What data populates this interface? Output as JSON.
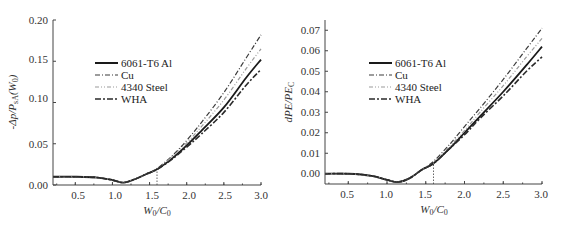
{
  "chart_data": [
    {
      "type": "line",
      "title": "",
      "xlabel": "W0/C0",
      "ylabel": "-Δp/P_sA(W0)",
      "xlim": [
        0.2,
        3.0
      ],
      "ylim": [
        0.0,
        0.2
      ],
      "xticks": [
        "0.5",
        "1.0",
        "1.5",
        "2.0",
        "2.5",
        "3.0"
      ],
      "yticks": [
        "0.00",
        "0.05",
        "0.10",
        "0.15",
        "0.20"
      ],
      "grid": false,
      "legend_position": "upper-left-center",
      "annotation": "vertical dotted line at W0/C0 = 1.6",
      "x": [
        0.2,
        0.5,
        0.8,
        1.0,
        1.15,
        1.3,
        1.45,
        1.6,
        1.8,
        2.0,
        2.2,
        2.5,
        2.8,
        3.0
      ],
      "series": [
        {
          "name": "6061-T6 Al",
          "style": "solid",
          "values": [
            0.01,
            0.01,
            0.009,
            0.006,
            0.003,
            0.007,
            0.013,
            0.019,
            0.032,
            0.048,
            0.066,
            0.094,
            0.13,
            0.152
          ]
        },
        {
          "name": "Cu",
          "style": "dash-dot",
          "values": [
            0.01,
            0.01,
            0.009,
            0.006,
            0.003,
            0.007,
            0.013,
            0.02,
            0.035,
            0.054,
            0.076,
            0.112,
            0.154,
            0.182
          ]
        },
        {
          "name": "4340 Steel",
          "style": "dash-dot-dot-light",
          "values": [
            0.01,
            0.01,
            0.009,
            0.006,
            0.003,
            0.007,
            0.013,
            0.019,
            0.034,
            0.051,
            0.071,
            0.103,
            0.141,
            0.165
          ]
        },
        {
          "name": "WHA",
          "style": "dash-dot-heavy",
          "values": [
            0.01,
            0.01,
            0.009,
            0.006,
            0.003,
            0.007,
            0.013,
            0.019,
            0.031,
            0.046,
            0.062,
            0.088,
            0.121,
            0.14
          ]
        }
      ]
    },
    {
      "type": "line",
      "title": "",
      "xlabel": "W0/C0",
      "ylabel": "dPE/PE_C",
      "xlim": [
        0.2,
        3.0
      ],
      "ylim": [
        -0.005,
        0.075
      ],
      "xticks": [
        "0.5",
        "1.0",
        "1.5",
        "2.0",
        "2.5",
        "3.0"
      ],
      "yticks": [
        "0.00",
        "0.01",
        "0.02",
        "0.03",
        "0.04",
        "0.05",
        "0.06",
        "0.07"
      ],
      "grid": false,
      "legend_position": "upper-left-center",
      "annotation": "vertical dotted line at W0/C0 = 1.6",
      "x": [
        0.2,
        0.5,
        0.8,
        1.0,
        1.15,
        1.3,
        1.45,
        1.6,
        1.8,
        2.0,
        2.2,
        2.5,
        2.8,
        3.0
      ],
      "series": [
        {
          "name": "6061-T6 Al",
          "style": "solid",
          "values": [
            0.0,
            0.0,
            -0.001,
            -0.003,
            -0.004,
            -0.002,
            0.002,
            0.005,
            0.012,
            0.02,
            0.028,
            0.04,
            0.053,
            0.062
          ]
        },
        {
          "name": "Cu",
          "style": "dash-dot",
          "values": [
            0.0,
            0.0,
            -0.001,
            -0.003,
            -0.004,
            -0.002,
            0.002,
            0.006,
            0.014,
            0.023,
            0.032,
            0.046,
            0.061,
            0.071
          ]
        },
        {
          "name": "4340 Steel",
          "style": "dash-dot-dot-light",
          "values": [
            0.0,
            0.0,
            -0.001,
            -0.003,
            -0.004,
            -0.002,
            0.002,
            0.005,
            0.013,
            0.021,
            0.03,
            0.043,
            0.057,
            0.066
          ]
        },
        {
          "name": "WHA",
          "style": "dash-dot-heavy",
          "values": [
            0.0,
            0.0,
            -0.001,
            -0.003,
            -0.004,
            -0.002,
            0.002,
            0.005,
            0.012,
            0.019,
            0.027,
            0.038,
            0.05,
            0.057
          ]
        }
      ]
    }
  ],
  "left": {
    "ylabel": "-Δp/P",
    "ylabel_sub": "sA",
    "ylabel_tail": "(W",
    "ylabel_sub2": "0",
    "ylabel_end": ")",
    "xlabel_w": "W",
    "xlabel_sub1": "0",
    "xlabel_c": "/C",
    "xlabel_sub2": "0",
    "yticks": [
      "0.00",
      "0.05",
      "0.10",
      "0.15",
      "0.20"
    ],
    "xticks": [
      "0.5",
      "1.0",
      "1.5",
      "2.0",
      "2.5",
      "3.0"
    ],
    "legend": [
      "6061-T6 Al",
      "Cu",
      "4340 Steel",
      "WHA"
    ]
  },
  "right": {
    "ylabel": "dPE/PE",
    "ylabel_sub": "C",
    "xlabel_w": "W",
    "xlabel_sub1": "0",
    "xlabel_c": "/C",
    "xlabel_sub2": "0",
    "yticks": [
      "0.00",
      "0.01",
      "0.02",
      "0.03",
      "0.04",
      "0.05",
      "0.06",
      "0.07"
    ],
    "xticks": [
      "0.5",
      "1.0",
      "1.5",
      "2.0",
      "2.5",
      "3.0"
    ],
    "legend": [
      "6061-T6 Al",
      "Cu",
      "4340 Steel",
      "WHA"
    ]
  },
  "colors": {
    "al": "#1a1a1a",
    "cu": "#3a3a3a",
    "steel": "#9a9a9a",
    "wha": "#2a2a2a",
    "axis": "#444444"
  }
}
